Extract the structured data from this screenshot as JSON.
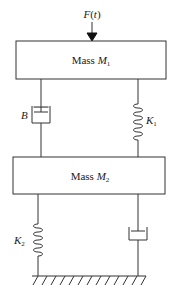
{
  "diagram": {
    "force": {
      "label_fn": "F",
      "label_arg": "t",
      "icon": "arrow-down"
    },
    "mass1": {
      "prefix": "Mass ",
      "symbol": "M",
      "subscript": "1"
    },
    "mass2": {
      "prefix": "Mass ",
      "symbol": "M",
      "subscript": "2"
    },
    "damper_top": {
      "label": "B"
    },
    "spring_top": {
      "symbol": "K",
      "subscript": "1"
    },
    "spring_bottom": {
      "symbol": "K",
      "subscript": "2"
    },
    "damper_bottom": {
      "label": ""
    },
    "ground": {
      "icon": "ground-hatch"
    },
    "colors": {
      "line": "#333333",
      "background": "#ffffff"
    }
  }
}
